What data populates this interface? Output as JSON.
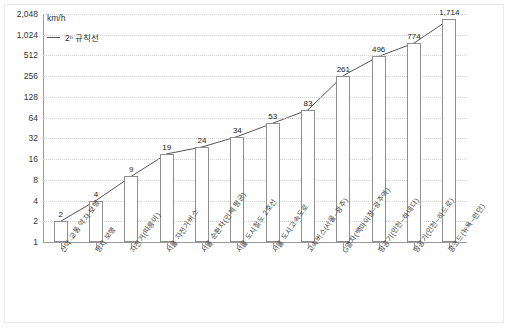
{
  "chart_data": {
    "type": "bar",
    "title": "",
    "subtitle": "",
    "xlabel": "",
    "ylabel": "km/h",
    "yscale": "log2",
    "ylim": [
      1,
      2048
    ],
    "grid": true,
    "legend_position": "top-left",
    "ytick_labels": [
      "2,048",
      "1,024",
      "512",
      "256",
      "128",
      "64",
      "32",
      "16",
      "8",
      "4",
      "2",
      "1"
    ],
    "ytick_values": [
      2048,
      1024,
      512,
      256,
      128,
      64,
      32,
      16,
      8,
      4,
      2,
      1
    ],
    "categories": [
      "산악·교통 약자 보행",
      "평지 보행",
      "자전거(따릉이)",
      "서울 자전거버스",
      "서울 순환차(인체 평균)",
      "서울 도시철도 2호선",
      "서울 도시고속도로",
      "고속버스(서울–광주)",
      "G열차(백마이장–광주역)",
      "항공기(인천–하네다)",
      "항공기(인천–히드로)",
      "콩코드(뉴욕–런던)"
    ],
    "values": [
      2,
      4,
      9,
      19,
      24,
      34,
      53,
      83,
      261,
      496,
      774,
      1714
    ],
    "value_labels": [
      "2",
      "4",
      "9",
      "19",
      "24",
      "34",
      "53",
      "83",
      "261",
      "496",
      "774",
      "1,714"
    ],
    "series": [
      {
        "name": "2ⁿ 규칙선",
        "type": "line",
        "values": [
          2,
          4,
          9,
          19,
          24,
          34,
          53,
          83,
          261,
          496,
          774,
          1714
        ]
      }
    ],
    "legend": [
      {
        "label": "2ⁿ 규칙선",
        "marker": "line",
        "color": "#555555"
      }
    ],
    "unit_label": "km/h",
    "colors": {
      "bar_fill": "#ffffff",
      "bar_stroke": "#8f8f8f",
      "grid": "#d2d2d2",
      "axis": "#9a9a9a",
      "text": "#333333",
      "reference_line": "#555555"
    }
  }
}
